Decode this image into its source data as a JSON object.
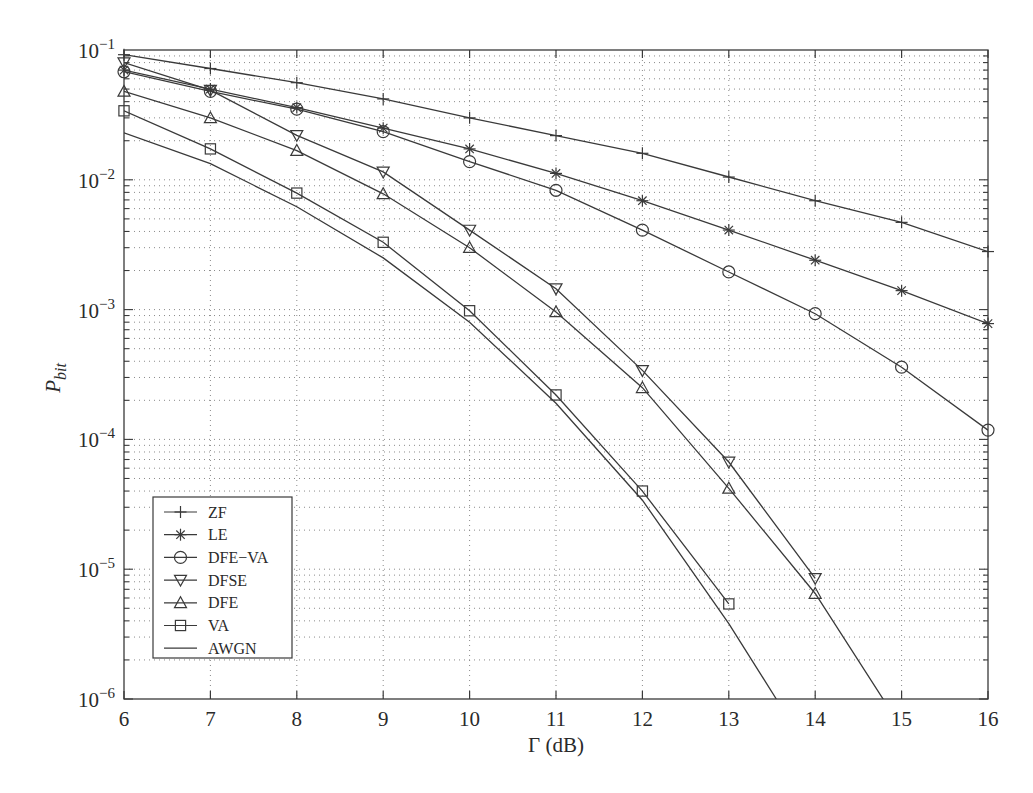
{
  "chart_data": {
    "type": "line",
    "title": "",
    "xlabel": "Γ (dB)",
    "ylabel": "P_bit",
    "ylabel_main": "P",
    "ylabel_sub": "bit",
    "xscale": "linear",
    "yscale": "log",
    "xlim": [
      6,
      16
    ],
    "ylim": [
      1e-06,
      0.1
    ],
    "x_ticks": [
      6,
      7,
      8,
      9,
      10,
      11,
      12,
      13,
      14,
      15,
      16
    ],
    "y_ticks": [
      {
        "base": "10",
        "exp": "−1",
        "value": 0.1
      },
      {
        "base": "10",
        "exp": "−2",
        "value": 0.01
      },
      {
        "base": "10",
        "exp": "−3",
        "value": 0.001
      },
      {
        "base": "10",
        "exp": "−4",
        "value": 0.0001
      },
      {
        "base": "10",
        "exp": "−5",
        "value": 1e-05
      },
      {
        "base": "10",
        "exp": "−6",
        "value": 1e-06
      }
    ],
    "grid": true,
    "legend_position": "lower left",
    "series": [
      {
        "name": "ZF",
        "marker": "plus",
        "x": [
          6,
          7,
          8,
          9,
          10,
          11,
          12,
          13,
          14,
          15,
          16
        ],
        "values": [
          0.092,
          0.072,
          0.056,
          0.042,
          0.03,
          0.0219,
          0.016,
          0.0105,
          0.0069,
          0.0047,
          0.0028
        ]
      },
      {
        "name": "LE",
        "marker": "star",
        "x": [
          6,
          7,
          8,
          9,
          10,
          11,
          12,
          13,
          14,
          15,
          16
        ],
        "values": [
          0.07,
          0.05,
          0.036,
          0.025,
          0.0173,
          0.0112,
          0.0069,
          0.0041,
          0.0024,
          0.0014,
          0.00078
        ]
      },
      {
        "name": "DFE−VA",
        "marker": "circle",
        "x": [
          6,
          7,
          8,
          9,
          10,
          11,
          12,
          13,
          14,
          15,
          16
        ],
        "values": [
          0.068,
          0.048,
          0.035,
          0.0235,
          0.0138,
          0.0083,
          0.0041,
          0.00195,
          0.00093,
          0.00036,
          0.000118
        ]
      },
      {
        "name": "DFSE",
        "marker": "triangle-down",
        "x": [
          6,
          7,
          8,
          9,
          10,
          11,
          12,
          13,
          14
        ],
        "values": [
          0.08,
          0.049,
          0.022,
          0.0115,
          0.0041,
          0.00145,
          0.00034,
          6.7e-05,
          8.5e-06
        ]
      },
      {
        "name": "DFE",
        "marker": "triangle-up",
        "x": [
          6,
          7,
          8,
          9,
          10,
          11,
          12,
          13,
          14,
          15
        ],
        "values": [
          0.048,
          0.03,
          0.0168,
          0.0078,
          0.003,
          0.00096,
          0.00025,
          4.2e-05,
          6.5e-06,
          6e-07
        ],
        "marker_mask": [
          true,
          true,
          true,
          true,
          true,
          true,
          true,
          true,
          true,
          false
        ]
      },
      {
        "name": "VA",
        "marker": "square",
        "x": [
          6,
          7,
          8,
          9,
          10,
          11,
          12,
          13
        ],
        "values": [
          0.034,
          0.0173,
          0.0079,
          0.0033,
          0.00098,
          0.00022,
          4e-05,
          5.4e-06
        ]
      },
      {
        "name": "AWGN",
        "marker": "none",
        "x": [
          6,
          7,
          8,
          9,
          10,
          11,
          12,
          13,
          13.55
        ],
        "values": [
          0.023,
          0.0133,
          0.0062,
          0.0025,
          0.0008,
          0.00019,
          3.4e-05,
          3.8e-06,
          1e-06
        ]
      }
    ]
  },
  "colors": {
    "background": "#ffffff",
    "line": "#3a3a3a",
    "grid": "#8a8a8a",
    "text": "#2a2a2a"
  }
}
